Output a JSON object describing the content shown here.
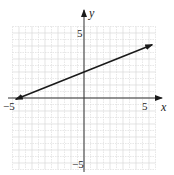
{
  "chart_data": {
    "type": "line",
    "title": "",
    "xlabel": "x",
    "ylabel": "y",
    "xlim": [
      -5,
      5
    ],
    "ylim": [
      -5,
      5
    ],
    "grid": true,
    "grid_step": 1,
    "tick_labels": {
      "x": [
        "-5",
        "5"
      ],
      "y": [
        "5",
        "-5"
      ]
    },
    "series": [
      {
        "name": "y = (2/5)x + 2",
        "equation": "y = 0.4x + 2",
        "x": [
          -5,
          5
        ],
        "y": [
          0,
          4
        ],
        "arrows": "both"
      }
    ],
    "colors": {
      "line": "#1a1a1a",
      "axis": "#333333",
      "grid": "#d8d8d8"
    }
  },
  "labels": {
    "x_axis": "x",
    "y_axis": "y",
    "x_min": "−5",
    "x_max": "5",
    "y_max": "5",
    "y_min": "−5"
  }
}
